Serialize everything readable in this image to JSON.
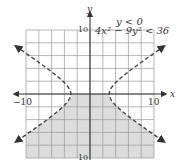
{
  "chart_data": {
    "type": "line",
    "title": "",
    "annotations": [
      "y < 0",
      "4x² − 9y² < 36"
    ],
    "xlabel": "x",
    "ylabel": "y",
    "xlim": [
      -10,
      10
    ],
    "ylim": [
      -10,
      10
    ],
    "grid": true,
    "grid_step": 2,
    "tick_labels": {
      "x_left": "−10",
      "x_right": "10",
      "y_top": "10",
      "y_bottom": "10"
    },
    "series": [
      {
        "name": "boundary 4x² − 9y² = 36 (right branch)",
        "style": "dashed",
        "equation": "x = 3*sqrt(1 + y^2/4)",
        "vertex": [
          3,
          0
        ],
        "arrow_ends": [
          [
            10.5,
            7.5
          ],
          [
            10.5,
            -7.5
          ]
        ]
      },
      {
        "name": "boundary 4x² − 9y² = 36 (left branch)",
        "style": "dashed",
        "equation": "x = -3*sqrt(1 + y^2/4)",
        "vertex": [
          -3,
          0
        ],
        "arrow_ends": [
          [
            -10.5,
            7.5
          ],
          [
            -10.5,
            -7.5
          ]
        ]
      },
      {
        "name": "boundary y = 0",
        "style": "solid",
        "note": "along x-axis between branches"
      }
    ],
    "shaded_region": {
      "description": "y < 0 and 4x² − 9y² < 36 (between branches, below x-axis)",
      "color": "#dcdcdc"
    },
    "colors": {
      "grid": "#9a9a9a",
      "axis": "#333333",
      "curve": "#444444",
      "shade": "#dcdcdc"
    }
  }
}
